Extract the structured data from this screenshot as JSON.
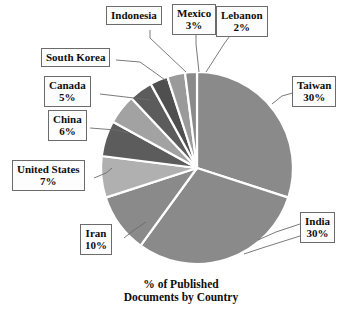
{
  "chart_data": {
    "type": "pie",
    "title": "% of Published Documents by Country",
    "caption_line1": "% of Published",
    "caption_line2": "Documents by Country",
    "categories": [
      "Taiwan",
      "India",
      "Iran",
      "United States",
      "China",
      "Canada",
      "South Korea",
      "Indonesia",
      "Mexico",
      "Lebanon"
    ],
    "values": [
      30,
      30,
      10,
      7,
      6,
      5,
      4,
      3,
      3,
      2
    ],
    "unit": "%",
    "legend": "none",
    "labels_position": "callout-boxes-outside",
    "start_angle_deg": 0,
    "direction": "clockwise",
    "slices": [
      {
        "name": "Taiwan",
        "pct_label": "30%",
        "value": 30,
        "color": "#8a8a8a"
      },
      {
        "name": "India",
        "pct_label": "30%",
        "value": 30,
        "color": "#8a8a8a"
      },
      {
        "name": "Iran",
        "pct_label": "10%",
        "value": 10,
        "color": "#8a8a8a"
      },
      {
        "name": "United States",
        "pct_label": "7%",
        "value": 7,
        "color": "#b0b0b0"
      },
      {
        "name": "China",
        "pct_label": "6%",
        "value": 6,
        "color": "#5c5c5c"
      },
      {
        "name": "Canada",
        "pct_label": "5%",
        "value": 5,
        "color": "#a2a2a2"
      },
      {
        "name": "South Korea",
        "pct_label": "",
        "value": 4,
        "color": "#5c5c5c"
      },
      {
        "name": "Indonesia",
        "pct_label": "",
        "value": 3,
        "color": "#4f4f4f"
      },
      {
        "name": "Mexico",
        "pct_label": "3%",
        "value": 3,
        "color": "#9a9a9a"
      },
      {
        "name": "Lebanon",
        "pct_label": "2%",
        "value": 2,
        "color": "#8a8a8a"
      }
    ],
    "colors": {
      "medium_gray": "#8a8a8a",
      "light_gray": "#b0b0b0",
      "dark_gray": "#5c5c5c",
      "separator": "#ffffff",
      "label_border": "#6b6b6b",
      "label_text": "#0d0d0d",
      "background": "#ffffff"
    }
  },
  "callouts": {
    "taiwan": {
      "name": "Taiwan",
      "pct": "30%"
    },
    "india": {
      "name": "India",
      "pct": "30%"
    },
    "iran": {
      "name": "Iran",
      "pct": "10%"
    },
    "united_states": {
      "name": "United States",
      "pct": "7%"
    },
    "china": {
      "name": "China",
      "pct": "6%"
    },
    "canada": {
      "name": "Canada",
      "pct": "5%"
    },
    "south_korea": {
      "name": "South Korea",
      "pct": ""
    },
    "indonesia": {
      "name": "Indonesia",
      "pct": ""
    },
    "mexico": {
      "name": "Mexico",
      "pct": "3%"
    },
    "lebanon": {
      "name": "Lebanon",
      "pct": "2%"
    }
  }
}
